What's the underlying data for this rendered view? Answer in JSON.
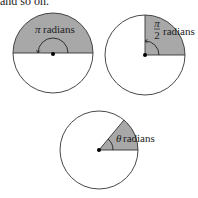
{
  "caption": "and so on.",
  "colors": {
    "fill": "#a8a8a8",
    "stroke": "#333333",
    "background": "#ffffff"
  },
  "diagrams": [
    {
      "label_symbol": "π",
      "label_unit": "radians"
    },
    {
      "label_num": "π",
      "label_den": "2",
      "label_unit": "radians"
    },
    {
      "label_symbol": "θ",
      "label_unit": "radians"
    }
  ]
}
